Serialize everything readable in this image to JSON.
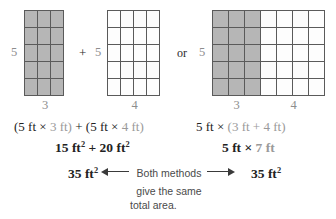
{
  "figure": {
    "grids": [
      {
        "id": "grid-a",
        "cols": 3,
        "rows": 5,
        "shaded_cols": 3,
        "height_label": "5",
        "width_labels": [
          "3"
        ]
      },
      {
        "id": "grid-b",
        "cols": 4,
        "rows": 5,
        "shaded_cols": 0,
        "height_label": "5",
        "width_labels": [
          "4"
        ]
      },
      {
        "id": "grid-c",
        "cols": 7,
        "rows": 5,
        "shaded_cols": 3,
        "height_label": "5",
        "width_labels": [
          "3",
          "4"
        ]
      }
    ],
    "operators": {
      "plus": "+",
      "or": "or"
    },
    "colors": {
      "shaded_cell": "#b6b6b6",
      "plain_cell": "#fdfdfd",
      "grid_line": "#5a5a5a",
      "dim_text": "#9a9a9a",
      "dark_text": "#222222",
      "caption_text": "#4a4a4a"
    }
  },
  "equations": {
    "left": {
      "line1_parts": [
        {
          "text": "(5 ft ",
          "style": "dark"
        },
        {
          "text": "×",
          "style": "dark"
        },
        {
          "text": " 3 ft)",
          "style": "dim"
        },
        {
          "text": " + ",
          "style": "dark"
        },
        {
          "text": "(5 ft ",
          "style": "dark"
        },
        {
          "text": "×",
          "style": "dark"
        },
        {
          "text": " 4 ft)",
          "style": "dim"
        }
      ],
      "line1_plain": "(5 ft × 3 ft) + (5 ft × 4 ft)",
      "line2_plain": "15 ft² + 20 ft²",
      "line3_plain": "35 ft²"
    },
    "right": {
      "line1_plain": "5 ft × (3 ft + 4 ft)",
      "line2_plain": "5 ft × 7 ft",
      "line3_plain": "35 ft²"
    },
    "tokens": {
      "five_ft": "5 ft",
      "three_ft": "3 ft",
      "four_ft": "4 ft",
      "seven_ft": "7 ft",
      "times": "×",
      "plus": "+",
      "open_paren": "(",
      "close_paren": ")",
      "fifteen": "15 ft",
      "twenty": "20 ft",
      "thirtyfive": "35 ft",
      "exponent": "2"
    }
  },
  "caption": {
    "line1": "Both methods",
    "line2": "give the same",
    "line3": "total area.",
    "arrow_left": "left-arrow-icon",
    "arrow_right": "right-arrow-icon"
  }
}
